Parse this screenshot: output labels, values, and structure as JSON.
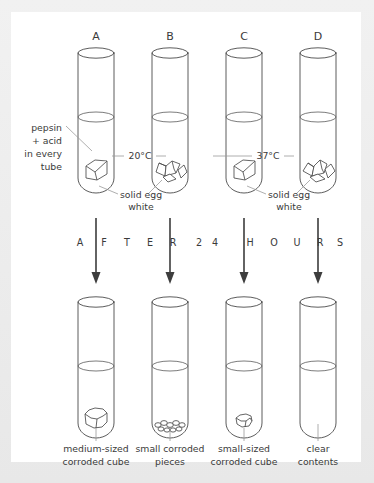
{
  "figure": {
    "banner_text": "AFTER 24 HOURS",
    "banner_letters": [
      "A",
      "F",
      "T",
      "E",
      "R",
      "2",
      "4",
      "H",
      "O",
      "U",
      "R",
      "S"
    ],
    "side_note": {
      "line1": "pepsin",
      "line2": "+ acid",
      "line3": "in every",
      "line4": "tube"
    },
    "egg_label": {
      "line1": "solid egg",
      "line2": "white"
    },
    "temperatures": [
      {
        "id": "temp-left",
        "value": "20°C"
      },
      {
        "id": "temp-right",
        "value": "37°C"
      }
    ],
    "colors": {
      "page_background": "#d9d9d9",
      "card_background": "#ffffff",
      "frame_background": "#eeeeee",
      "ink": "#3a3a3a",
      "glass_stroke": "#4a4a4a",
      "leader_stroke": "#9a9a9a",
      "arrow": "#3d3d3d"
    }
  },
  "tubes_before": [
    {
      "label": "A",
      "contents": "solid cube",
      "temperature": "20°C"
    },
    {
      "label": "B",
      "contents": "solid pieces",
      "temperature": "20°C"
    },
    {
      "label": "C",
      "contents": "solid cube",
      "temperature": "37°C"
    },
    {
      "label": "D",
      "contents": "solid pieces",
      "temperature": "37°C"
    }
  ],
  "tubes_after": [
    {
      "label": "A",
      "caption_line1": "medium-sized",
      "caption_line2": "corroded cube"
    },
    {
      "label": "B",
      "caption_line1": "small corroded",
      "caption_line2": "pieces"
    },
    {
      "label": "C",
      "caption_line1": "small-sized",
      "caption_line2": "corroded cube"
    },
    {
      "label": "D",
      "caption_line1": "clear",
      "caption_line2": "contents"
    }
  ]
}
